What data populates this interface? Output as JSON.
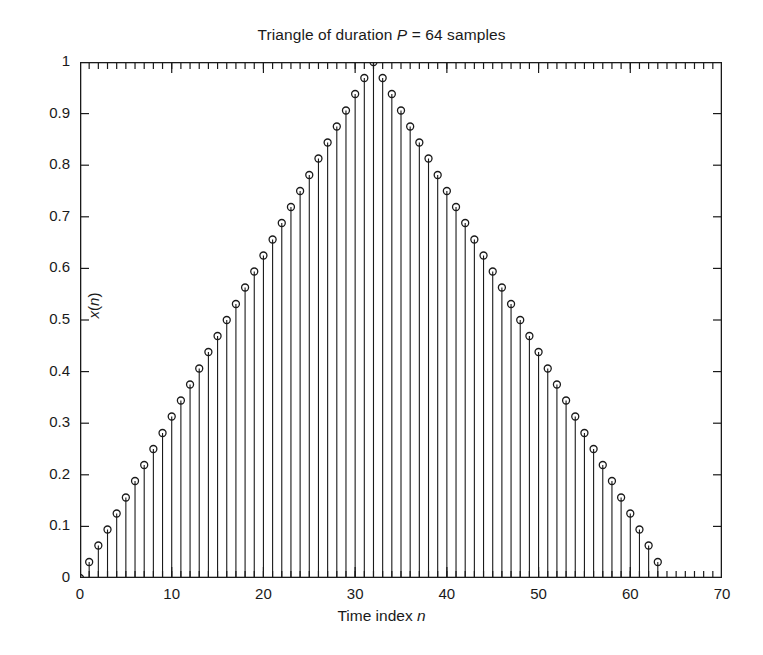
{
  "figure": {
    "background_color": "#ffffff",
    "ink_color": "#1a1a1a",
    "width": 763,
    "height": 655
  },
  "title": {
    "prefix": "Triangle of duration ",
    "italic_symbol": "P",
    "suffix": " = 64 samples",
    "full": "Triangle of duration P = 64 samples"
  },
  "axes": {
    "xlabel_prefix": "Time index ",
    "xlabel_italic": "n",
    "xlabel_full": "Time index n",
    "ylabel_prefix": "x",
    "ylabel_full": "x(n)",
    "ylabel_paren_open": "(",
    "ylabel_italic": "n",
    "ylabel_paren_close": ")",
    "x_ticks": [
      "0",
      "10",
      "20",
      "30",
      "40",
      "50",
      "60",
      "70"
    ],
    "y_ticks": [
      "0",
      "0.1",
      "0.2",
      "0.3",
      "0.4",
      "0.5",
      "0.6",
      "0.7",
      "0.8",
      "0.9",
      "1"
    ],
    "box_color": "#1a1a1a",
    "tick_direction": "in",
    "x_minor_tick_count": 70
  },
  "chart_data": {
    "type": "scatter",
    "plot_style": "stem",
    "title": "Triangle of duration P = 64 samples",
    "xlabel": "Time index n",
    "ylabel": "x(n)",
    "xlim": [
      0,
      70
    ],
    "ylim": [
      0,
      1
    ],
    "xtick_values": [
      0,
      10,
      20,
      30,
      40,
      50,
      60,
      70
    ],
    "ytick_values": [
      0,
      0.1,
      0.2,
      0.3,
      0.4,
      0.5,
      0.6,
      0.7,
      0.8,
      0.9,
      1.0
    ],
    "grid": false,
    "legend": false,
    "marker": "open-circle",
    "marker_size": 7,
    "series": [
      {
        "name": "x(n)",
        "description": "Triangular window of duration P = 64 samples, peak 1.0 at n = 32",
        "x": [
          0,
          1,
          2,
          3,
          4,
          5,
          6,
          7,
          8,
          9,
          10,
          11,
          12,
          13,
          14,
          15,
          16,
          17,
          18,
          19,
          20,
          21,
          22,
          23,
          24,
          25,
          26,
          27,
          28,
          29,
          30,
          31,
          32,
          33,
          34,
          35,
          36,
          37,
          38,
          39,
          40,
          41,
          42,
          43,
          44,
          45,
          46,
          47,
          48,
          49,
          50,
          51,
          52,
          53,
          54,
          55,
          56,
          57,
          58,
          59,
          60,
          61,
          62,
          63
        ],
        "y": [
          0.0,
          0.031,
          0.063,
          0.094,
          0.125,
          0.156,
          0.188,
          0.219,
          0.25,
          0.281,
          0.313,
          0.344,
          0.375,
          0.406,
          0.438,
          0.469,
          0.5,
          0.531,
          0.563,
          0.594,
          0.625,
          0.656,
          0.688,
          0.719,
          0.75,
          0.781,
          0.813,
          0.844,
          0.875,
          0.906,
          0.938,
          0.969,
          1.0,
          0.969,
          0.938,
          0.906,
          0.875,
          0.844,
          0.813,
          0.781,
          0.75,
          0.719,
          0.688,
          0.656,
          0.625,
          0.594,
          0.563,
          0.531,
          0.5,
          0.469,
          0.438,
          0.406,
          0.375,
          0.344,
          0.313,
          0.281,
          0.25,
          0.219,
          0.188,
          0.156,
          0.125,
          0.094,
          0.063,
          0.031
        ]
      }
    ]
  }
}
